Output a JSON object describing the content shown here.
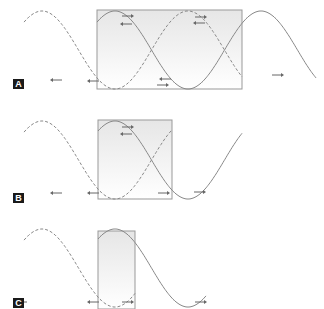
{
  "panels": [
    {
      "id": "A",
      "label": "A",
      "label_pos": [
        13,
        79
      ],
      "box": {
        "x": 97,
        "y": 10,
        "w": 145,
        "h": 79
      },
      "baseline": 50,
      "amp": 39,
      "solid_range": [
        97,
        316
      ],
      "dashed_range": [
        24,
        242
      ],
      "arrows": [
        {
          "x": 122,
          "y": 16,
          "dir": "right"
        },
        {
          "x": 132,
          "y": 24,
          "dir": "left"
        },
        {
          "x": 195,
          "y": 17,
          "dir": "right"
        },
        {
          "x": 205,
          "y": 23,
          "dir": "left"
        },
        {
          "x": 62,
          "y": 80,
          "dir": "left"
        },
        {
          "x": 99,
          "y": 81,
          "dir": "left"
        },
        {
          "x": 157,
          "y": 85,
          "dir": "right"
        },
        {
          "x": 171,
          "y": 79,
          "dir": "left"
        },
        {
          "x": 272,
          "y": 75,
          "dir": "right"
        }
      ]
    },
    {
      "id": "B",
      "label": "B",
      "label_pos": [
        13,
        193
      ],
      "box": {
        "x": 98,
        "y": 120,
        "w": 74,
        "h": 79
      },
      "baseline": 160,
      "amp": 39,
      "solid_range": [
        98,
        242
      ],
      "dashed_range": [
        24,
        172
      ],
      "arrows": [
        {
          "x": 122,
          "y": 127,
          "dir": "right"
        },
        {
          "x": 132,
          "y": 134,
          "dir": "left"
        },
        {
          "x": 62,
          "y": 193,
          "dir": "left"
        },
        {
          "x": 99,
          "y": 193,
          "dir": "left"
        },
        {
          "x": 158,
          "y": 193,
          "dir": "right"
        },
        {
          "x": 194,
          "y": 192,
          "dir": "right"
        }
      ]
    },
    {
      "id": "C",
      "label": "C",
      "label_pos": [
        13,
        298
      ],
      "box": {
        "x": 98,
        "y": 231,
        "w": 37,
        "h": 78
      },
      "baseline": 268,
      "amp": 39,
      "solid_range": [
        98,
        206
      ],
      "dashed_range": [
        24,
        135
      ],
      "arrows": [
        {
          "x": 27,
          "y": 302,
          "dir": "left"
        },
        {
          "x": 99,
          "y": 302,
          "dir": "left"
        },
        {
          "x": 122,
          "y": 302,
          "dir": "right"
        },
        {
          "x": 195,
          "y": 302,
          "dir": "right"
        }
      ]
    }
  ],
  "colors": {
    "wave": "#888888",
    "box": "#999999",
    "box_fill": "#f0f0f0",
    "arrow": "#666666",
    "label_bg": "#1a1a1a"
  }
}
